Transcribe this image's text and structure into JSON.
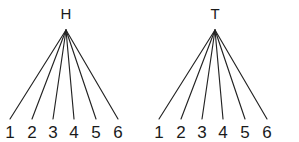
{
  "figure": {
    "type": "probability-tree-diagram",
    "background_color": "#ffffff",
    "line_color": "#232323",
    "text_color": "#1a1a1a",
    "width": 299,
    "height": 142
  },
  "trees": [
    {
      "id": "tree-heads",
      "root_label": "H",
      "root_x": 66,
      "root_y": 30,
      "label_x": 66,
      "label_y": 19,
      "leaf_y": 119,
      "leaf_text_y": 138,
      "leaves": [
        {
          "label": "1",
          "x": 10
        },
        {
          "label": "2",
          "x": 32
        },
        {
          "label": "3",
          "x": 53
        },
        {
          "label": "4",
          "x": 74
        },
        {
          "label": "5",
          "x": 96
        },
        {
          "label": "6",
          "x": 118
        }
      ]
    },
    {
      "id": "tree-tails",
      "root_label": "T",
      "root_x": 215,
      "root_y": 30,
      "label_x": 215,
      "label_y": 19,
      "leaf_y": 119,
      "leaf_text_y": 138,
      "leaves": [
        {
          "label": "1",
          "x": 159
        },
        {
          "label": "2",
          "x": 181
        },
        {
          "label": "3",
          "x": 202
        },
        {
          "label": "4",
          "x": 223
        },
        {
          "label": "5",
          "x": 245
        },
        {
          "label": "6",
          "x": 267
        }
      ]
    }
  ]
}
